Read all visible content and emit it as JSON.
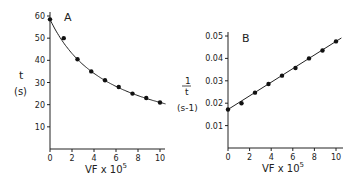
{
  "chart_data": [
    {
      "type": "scatter",
      "panel_label": "A",
      "title": "",
      "xlabel": "VF x 10",
      "xlabel_superscript": "5",
      "ylabel": "t",
      "ylabel_unit": "(s)",
      "xlim": [
        0,
        10
      ],
      "ylim": [
        0,
        60
      ],
      "xticks": [
        "0",
        "2",
        "4",
        "6",
        "8",
        "10"
      ],
      "yticks": [
        "10",
        "20",
        "30",
        "40",
        "50",
        "60"
      ],
      "grid": false,
      "legend": "none",
      "series": [
        {
          "name": "t",
          "x": [
            0,
            1.25,
            2.5,
            3.75,
            5,
            6.25,
            7.5,
            8.75,
            10
          ],
          "y": [
            58.5,
            50,
            40.5,
            35,
            31,
            28,
            25,
            23,
            21
          ],
          "fit": "hyperbolic curve (1/t linear)"
        }
      ]
    },
    {
      "type": "scatter",
      "panel_label": "B",
      "title": "",
      "xlabel": "VF x 10",
      "xlabel_superscript": "5",
      "ylabel": "1/t",
      "ylabel_unit": "(s-1)",
      "xlim": [
        0,
        10
      ],
      "ylim": [
        0,
        0.05
      ],
      "xticks": [
        "0",
        "2",
        "4",
        "6",
        "8",
        "10"
      ],
      "yticks": [
        "0.01",
        "0.02",
        "0.03",
        "0.04",
        "0.05"
      ],
      "grid": false,
      "legend": "none",
      "series": [
        {
          "name": "1/t",
          "x": [
            0,
            1.25,
            2.5,
            3.75,
            5,
            6.25,
            7.5,
            8.75,
            10
          ],
          "y": [
            0.0172,
            0.02,
            0.0247,
            0.0286,
            0.0323,
            0.0357,
            0.04,
            0.0435,
            0.0476
          ],
          "fit": "linear, y = 0.0172 + 0.00306x"
        }
      ]
    }
  ]
}
